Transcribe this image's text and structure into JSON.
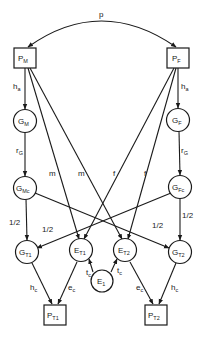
{
  "diagram": {
    "type": "path-diagram",
    "nodes": {
      "PM": {
        "main": "P",
        "sub": "M",
        "shape": "box"
      },
      "PF": {
        "main": "P",
        "sub": "F",
        "shape": "box"
      },
      "GM": {
        "main": "G",
        "sub": "M",
        "shape": "circle"
      },
      "GF": {
        "main": "G",
        "sub": "F",
        "shape": "circle"
      },
      "GMc": {
        "main": "G",
        "sub": "Mc",
        "shape": "circle"
      },
      "GFc": {
        "main": "G",
        "sub": "Fc",
        "shape": "circle"
      },
      "GT1": {
        "main": "G",
        "sub": "T1",
        "shape": "circle"
      },
      "ET1": {
        "main": "E",
        "sub": "T1",
        "shape": "circle"
      },
      "ET2": {
        "main": "E",
        "sub": "T2",
        "shape": "circle"
      },
      "GT2": {
        "main": "G",
        "sub": "T2",
        "shape": "circle"
      },
      "E1": {
        "main": "E",
        "sub": "1",
        "shape": "circle"
      },
      "PT1": {
        "main": "P",
        "sub": "T1",
        "shape": "box"
      },
      "PT2": {
        "main": "P",
        "sub": "T2",
        "shape": "box"
      }
    },
    "edge_labels": {
      "p": "p",
      "ha_left": {
        "main": "h",
        "sub": "a"
      },
      "ha_right": {
        "main": "h",
        "sub": "a"
      },
      "rg_left": {
        "main": "r",
        "sub": "G"
      },
      "rg_right": {
        "main": "r",
        "sub": "G"
      },
      "m1": "m",
      "m2": "m",
      "f1": "f",
      "f2": "f",
      "half_left_down": "1/2",
      "half_left_cross": "1/2",
      "half_right_cross": "1/2",
      "half_right_down": "1/2",
      "tc_left": {
        "main": "t",
        "sub": "c"
      },
      "tc_right": {
        "main": "t",
        "sub": "c"
      },
      "hc_left": {
        "main": "h",
        "sub": "c"
      },
      "ec_left": {
        "main": "e",
        "sub": "c"
      },
      "ec_right": {
        "main": "e",
        "sub": "c"
      },
      "hc_right": {
        "main": "h",
        "sub": "c"
      }
    },
    "edges": [
      {
        "from": "PM",
        "to": "PF",
        "label": "p",
        "bidirectional": true
      },
      {
        "from": "PM",
        "to": "GM",
        "label": "ha"
      },
      {
        "from": "PF",
        "to": "GF",
        "label": "ha"
      },
      {
        "from": "GM",
        "to": "GMc",
        "label": "rG"
      },
      {
        "from": "GF",
        "to": "GFc",
        "label": "rG"
      },
      {
        "from": "PM",
        "to": "ET1",
        "label": "m"
      },
      {
        "from": "PM",
        "to": "ET2",
        "label": "m"
      },
      {
        "from": "PF",
        "to": "ET1",
        "label": "f"
      },
      {
        "from": "PF",
        "to": "ET2",
        "label": "f"
      },
      {
        "from": "GMc",
        "to": "GT1",
        "label": "1/2"
      },
      {
        "from": "GMc",
        "to": "GT2",
        "label": "1/2"
      },
      {
        "from": "GFc",
        "to": "GT1",
        "label": "1/2"
      },
      {
        "from": "GFc",
        "to": "GT2",
        "label": "1/2"
      },
      {
        "from": "E1",
        "to": "ET1",
        "label": "tc"
      },
      {
        "from": "E1",
        "to": "ET2",
        "label": "tc"
      },
      {
        "from": "GT1",
        "to": "PT1",
        "label": "hc"
      },
      {
        "from": "ET1",
        "to": "PT1",
        "label": "ec"
      },
      {
        "from": "ET2",
        "to": "PT2",
        "label": "ec"
      },
      {
        "from": "GT2",
        "to": "PT2",
        "label": "hc"
      }
    ]
  }
}
